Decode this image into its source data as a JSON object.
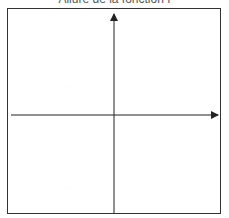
{
  "title": "Allure de la fonction f",
  "diagram": {
    "type": "cartesian-axes",
    "x_axis": {
      "label": ""
    },
    "y_axis": {
      "label": ""
    },
    "frame_color": "#333333",
    "axis_color": "#222222"
  }
}
